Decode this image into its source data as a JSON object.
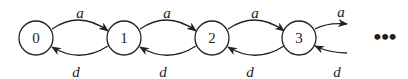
{
  "diagram": {
    "type": "birth-death-chain",
    "states": [
      {
        "id": "0",
        "label": "0"
      },
      {
        "id": "1",
        "label": "1"
      },
      {
        "id": "2",
        "label": "2"
      },
      {
        "id": "3",
        "label": "3"
      }
    ],
    "forward_label": "a",
    "backward_label": "d",
    "edges": [
      {
        "from": "0",
        "to": "1",
        "label": "a"
      },
      {
        "from": "1",
        "to": "0",
        "label": "d"
      },
      {
        "from": "1",
        "to": "2",
        "label": "a"
      },
      {
        "from": "2",
        "to": "1",
        "label": "d"
      },
      {
        "from": "2",
        "to": "3",
        "label": "a"
      },
      {
        "from": "3",
        "to": "2",
        "label": "d"
      },
      {
        "from": "3",
        "to": "…",
        "label": "a"
      },
      {
        "from": "…",
        "to": "3",
        "label": "d"
      }
    ],
    "continuation": "•••"
  }
}
